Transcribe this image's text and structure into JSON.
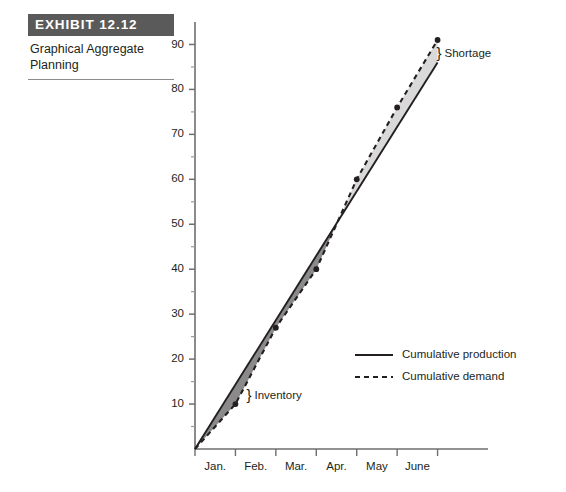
{
  "exhibit": {
    "number_label": "EXHIBIT 12.12",
    "caption": "Graphical Aggregate Planning"
  },
  "chart_data": {
    "type": "line",
    "title": "Graphical Aggregate Planning",
    "xlabel": "",
    "ylabel": "",
    "xlim": [
      0,
      7
    ],
    "ylim": [
      0,
      95
    ],
    "grid": false,
    "legend_position": "inside-lower-right",
    "x_tick_labels": [
      "Jan.",
      "Feb.",
      "Mar.",
      "Apr.",
      "May",
      "June"
    ],
    "x_tick_positions": [
      0.5,
      1.5,
      2.5,
      3.5,
      4.5,
      5.5
    ],
    "y_major_ticks": [
      10,
      20,
      30,
      40,
      50,
      60,
      70,
      80,
      90
    ],
    "y_minor_ticks": [
      5,
      15,
      25,
      35,
      45,
      55,
      65,
      75,
      85
    ],
    "y_tick_labels": [
      "10",
      "20",
      "30",
      "40",
      "50",
      "60",
      "70",
      "80",
      "90"
    ],
    "series": [
      {
        "name": "Cumulative production",
        "style": "solid",
        "x": [
          0,
          6
        ],
        "values": [
          0,
          86
        ]
      },
      {
        "name": "Cumulative demand",
        "style": "dashed",
        "x": [
          0,
          1,
          2,
          3,
          4,
          5,
          6
        ],
        "values": [
          0,
          10,
          27,
          40,
          60,
          76,
          91
        ],
        "markers": true
      }
    ],
    "annotations": [
      {
        "text": "Inventory",
        "brace": "}",
        "at_x": 1.1,
        "at_y": 12
      },
      {
        "text": "Shortage",
        "brace": "}",
        "at_x": 5.9,
        "at_y": 88
      }
    ],
    "legend": [
      {
        "label": "Cumulative production",
        "style": "solid"
      },
      {
        "label": "Cumulative demand",
        "style": "dashed"
      }
    ]
  },
  "colors": {
    "banner_bg": "#5a5a5a",
    "banner_text": "#ffffff",
    "line": "#231f20",
    "axis": "#6e6e6e",
    "inventory_fill": "#8a8a8a",
    "shortage_fill": "#d9d9d9",
    "text": "#231f20"
  }
}
